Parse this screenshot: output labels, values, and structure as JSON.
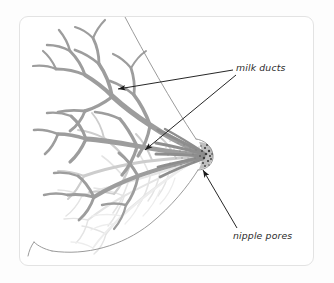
{
  "figure": {
    "kind": "anatomical-illustration",
    "view": "side-cutaway",
    "background_color": "#ffffff",
    "page_background_color": "#fdfdfd",
    "card": {
      "border_color": "#e3e3e3",
      "corner_radius_px": 9,
      "x": 19,
      "y": 16,
      "width": 295,
      "height": 250
    },
    "colors": {
      "duct_gray": "#9a9a9a",
      "duct_gray_mid": "#b0b0b0",
      "duct_faint": "#dcdcdc",
      "duct_very_faint": "#e8e8e8",
      "outline_gray": "#8c8c8c",
      "nipple_dark": "#4a4a4a",
      "arrow_black": "#1a1a1a",
      "text_color": "#2b2b2b"
    },
    "annotations": [
      {
        "id": "milk-ducts",
        "label": "milk ducts",
        "text_x": 236,
        "text_y": 63,
        "arrow_count": 2,
        "arrow_targets": [
          "upper-duct-branch",
          "central-duct-convergence"
        ]
      },
      {
        "id": "nipple-pores",
        "label": "nipple pores",
        "text_x": 233,
        "text_y": 231,
        "arrow_count": 1,
        "arrow_targets": [
          "nipple-tip"
        ]
      }
    ],
    "parts": [
      {
        "name": "milk-ducts",
        "description": "branching gray duct tree radiating outward from nipple"
      },
      {
        "name": "nipple",
        "description": "speckled dark nipple tip with pores at right of breast"
      },
      {
        "name": "breast-outline",
        "description": "thin skin contour from upper left curving to nipple and chest wall"
      },
      {
        "name": "chest-wall",
        "description": "lower curve sweeping left to the body edge"
      }
    ]
  }
}
